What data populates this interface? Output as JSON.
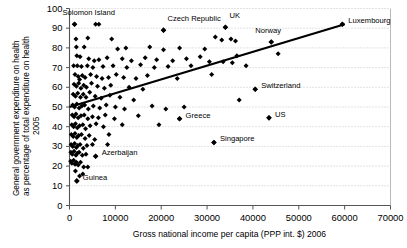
{
  "chart_data": {
    "type": "scatter",
    "title": "",
    "xlabel": "Gross national income per capita (PPP int. $) 2006",
    "ylabel_line1": "General government expenditure on health",
    "ylabel_line2": "as percentage of total expenditure on health",
    "ylabel_line3": "2005",
    "xlim": [
      0,
      70000
    ],
    "ylim": [
      0,
      100
    ],
    "xticks": [
      0,
      10000,
      20000,
      30000,
      40000,
      50000,
      60000,
      70000
    ],
    "yticks": [
      0,
      10,
      20,
      30,
      40,
      50,
      60,
      70,
      80,
      90,
      100
    ],
    "grid": "horizontal-dotted",
    "legend": "none",
    "marker": "diamond",
    "marker_color": "#000000",
    "trendline": {
      "type": "linear",
      "x_start": 0,
      "y_start": 50.0,
      "x_end": 60000,
      "y_end": 92.0,
      "color": "#000000"
    },
    "annotations": [
      {
        "label": "Solomon Island",
        "x": 1100,
        "y": 92.0,
        "lx": -12,
        "ly": -12
      },
      {
        "label": "Czech Republic",
        "x": 20500,
        "y": 89.0,
        "lx": 4,
        "ly": -12
      },
      {
        "label": "UK",
        "x": 34000,
        "y": 90.5,
        "lx": 4,
        "ly": -12
      },
      {
        "label": "Norway",
        "x": 44000,
        "y": 83.0,
        "lx": -16,
        "ly": -12
      },
      {
        "label": "Luxembourg",
        "x": 59500,
        "y": 92.0,
        "lx": 6,
        "ly": -4
      },
      {
        "label": "Switzerland",
        "x": 40500,
        "y": 59.0,
        "lx": 6,
        "ly": -4
      },
      {
        "label": "US",
        "x": 43500,
        "y": 44.5,
        "lx": 6,
        "ly": -4
      },
      {
        "label": "Greece",
        "x": 24000,
        "y": 44.0,
        "lx": 6,
        "ly": -4
      },
      {
        "label": "Singapore",
        "x": 31500,
        "y": 32.0,
        "lx": 6,
        "ly": -4
      },
      {
        "label": "Azerbaijan",
        "x": 5700,
        "y": 25.0,
        "lx": 6,
        "ly": -4
      },
      {
        "label": "Guinea",
        "x": 1600,
        "y": 12.5,
        "lx": 6,
        "ly": -4
      }
    ],
    "points": [
      [
        1100,
        92.0
      ],
      [
        5700,
        92.0
      ],
      [
        6400,
        92.0
      ],
      [
        20500,
        89.0
      ],
      [
        34000,
        90.5
      ],
      [
        59500,
        92.0
      ],
      [
        31800,
        85.5
      ],
      [
        33200,
        84.0
      ],
      [
        35200,
        84.5
      ],
      [
        36200,
        83.5
      ],
      [
        44000,
        83.0
      ],
      [
        1400,
        84.5
      ],
      [
        4000,
        85.0
      ],
      [
        9200,
        84.5
      ],
      [
        1500,
        80.5
      ],
      [
        3200,
        80.5
      ],
      [
        10500,
        79.5
      ],
      [
        12300,
        80.0
      ],
      [
        17500,
        80.5
      ],
      [
        20500,
        79.0
      ],
      [
        24000,
        80.0
      ],
      [
        29500,
        79.5
      ],
      [
        900,
        71.0
      ],
      [
        1600,
        76.0
      ],
      [
        2300,
        75.5
      ],
      [
        4200,
        74.5
      ],
      [
        5400,
        73.5
      ],
      [
        6400,
        74.0
      ],
      [
        8200,
        75.0
      ],
      [
        11500,
        74.5
      ],
      [
        13500,
        73.5
      ],
      [
        16500,
        75.0
      ],
      [
        19000,
        74.0
      ],
      [
        22500,
        73.5
      ],
      [
        25500,
        74.5
      ],
      [
        28500,
        75.5
      ],
      [
        30500,
        73.0
      ],
      [
        33500,
        73.0
      ],
      [
        36500,
        76.0
      ],
      [
        45500,
        77.0
      ],
      [
        1700,
        71.0
      ],
      [
        2600,
        70.5
      ],
      [
        3900,
        71.0
      ],
      [
        5100,
        70.0
      ],
      [
        7300,
        70.5
      ],
      [
        9500,
        71.0
      ],
      [
        12500,
        70.0
      ],
      [
        15500,
        71.5
      ],
      [
        18500,
        70.0
      ],
      [
        21500,
        70.5
      ],
      [
        26500,
        71.0
      ],
      [
        35500,
        72.5
      ],
      [
        38500,
        71.0
      ],
      [
        1200,
        66.5
      ],
      [
        1900,
        65.5
      ],
      [
        2200,
        64.0
      ],
      [
        2800,
        66.0
      ],
      [
        3400,
        65.0
      ],
      [
        4600,
        66.5
      ],
      [
        5900,
        65.5
      ],
      [
        7100,
        64.5
      ],
      [
        8500,
        65.0
      ],
      [
        10200,
        66.5
      ],
      [
        11800,
        65.0
      ],
      [
        14500,
        64.5
      ],
      [
        17000,
        66.0
      ],
      [
        23500,
        64.5
      ],
      [
        31000,
        66.5
      ],
      [
        1000,
        61.5
      ],
      [
        1500,
        60.5
      ],
      [
        2000,
        62.0
      ],
      [
        2500,
        59.5
      ],
      [
        3100,
        61.0
      ],
      [
        3700,
        60.0
      ],
      [
        4800,
        62.0
      ],
      [
        6100,
        60.5
      ],
      [
        7600,
        59.5
      ],
      [
        9000,
        61.0
      ],
      [
        13000,
        60.0
      ],
      [
        16000,
        59.0
      ],
      [
        40500,
        59.0
      ],
      [
        800,
        56.5
      ],
      [
        1300,
        55.5
      ],
      [
        1800,
        57.0
      ],
      [
        2400,
        55.0
      ],
      [
        3000,
        56.5
      ],
      [
        3600,
        55.0
      ],
      [
        4400,
        57.5
      ],
      [
        5600,
        55.5
      ],
      [
        6900,
        54.5
      ],
      [
        8800,
        56.0
      ],
      [
        11000,
        55.0
      ],
      [
        14000,
        53.5
      ],
      [
        37000,
        53.5
      ],
      [
        700,
        51.0
      ],
      [
        1100,
        50.0
      ],
      [
        1600,
        51.5
      ],
      [
        2100,
        49.5
      ],
      [
        2700,
        50.5
      ],
      [
        3300,
        51.0
      ],
      [
        4100,
        49.0
      ],
      [
        5200,
        50.5
      ],
      [
        6600,
        49.5
      ],
      [
        8000,
        51.0
      ],
      [
        10000,
        50.0
      ],
      [
        12000,
        49.0
      ],
      [
        18000,
        50.5
      ],
      [
        21000,
        49.0
      ],
      [
        25000,
        50.0
      ],
      [
        600,
        46.0
      ],
      [
        1000,
        45.0
      ],
      [
        1400,
        46.5
      ],
      [
        1900,
        44.5
      ],
      [
        2500,
        45.5
      ],
      [
        3200,
        46.0
      ],
      [
        4000,
        44.0
      ],
      [
        5000,
        45.0
      ],
      [
        6300,
        44.5
      ],
      [
        7800,
        46.0
      ],
      [
        9800,
        44.0
      ],
      [
        15000,
        45.5
      ],
      [
        24000,
        44.0
      ],
      [
        43500,
        44.5
      ],
      [
        500,
        41.0
      ],
      [
        900,
        40.0
      ],
      [
        1300,
        41.5
      ],
      [
        1700,
        39.5
      ],
      [
        2200,
        40.5
      ],
      [
        2900,
        41.0
      ],
      [
        3500,
        39.0
      ],
      [
        4500,
        40.5
      ],
      [
        5800,
        41.5
      ],
      [
        7400,
        40.0
      ],
      [
        11500,
        41.0
      ],
      [
        19500,
        41.0
      ],
      [
        400,
        36.0
      ],
      [
        800,
        35.0
      ],
      [
        1200,
        36.5
      ],
      [
        1600,
        34.5
      ],
      [
        2000,
        35.5
      ],
      [
        2600,
        36.0
      ],
      [
        3400,
        34.0
      ],
      [
        4300,
        35.5
      ],
      [
        5500,
        33.5
      ],
      [
        8600,
        36.0
      ],
      [
        350,
        31.0
      ],
      [
        700,
        30.0
      ],
      [
        1100,
        31.5
      ],
      [
        1500,
        29.5
      ],
      [
        1800,
        30.5
      ],
      [
        2300,
        31.0
      ],
      [
        3000,
        29.0
      ],
      [
        3800,
        30.5
      ],
      [
        5000,
        31.0
      ],
      [
        8300,
        31.0
      ],
      [
        31500,
        32.0
      ],
      [
        300,
        27.0
      ],
      [
        600,
        26.0
      ],
      [
        1000,
        27.5
      ],
      [
        1400,
        25.5
      ],
      [
        1700,
        26.5
      ],
      [
        2100,
        27.0
      ],
      [
        2800,
        25.5
      ],
      [
        3600,
        26.0
      ],
      [
        5700,
        25.0
      ],
      [
        250,
        22.5
      ],
      [
        500,
        21.5
      ],
      [
        900,
        23.0
      ],
      [
        1200,
        21.0
      ],
      [
        1500,
        22.0
      ],
      [
        1900,
        20.5
      ],
      [
        2400,
        22.0
      ],
      [
        3100,
        19.5
      ],
      [
        4000,
        19.5
      ],
      [
        1600,
        12.5
      ],
      [
        2200,
        15.0
      ],
      [
        1300,
        17.5
      ],
      [
        2900,
        16.0
      ]
    ]
  }
}
